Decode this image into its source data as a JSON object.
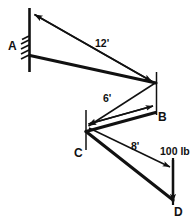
{
  "figure": {
    "type": "engineering-free-body-diagram",
    "ink_color": "#111111",
    "background_color": "#ffffff"
  },
  "supports": [
    {
      "name": "fixed-wall-support",
      "at_node": "A",
      "hatching_marks": 5
    }
  ],
  "nodes": [
    {
      "id": "A",
      "label": "A"
    },
    {
      "id": "B",
      "label": "B"
    },
    {
      "id": "C",
      "label": "C"
    },
    {
      "id": "D",
      "label": "D"
    }
  ],
  "members": [
    {
      "id": "AB",
      "from": "A",
      "to": "B"
    },
    {
      "id": "BC",
      "from": "B",
      "to": "C"
    },
    {
      "id": "CD",
      "from": "C",
      "to": "D"
    }
  ],
  "dimensions": [
    {
      "id": "AB-length",
      "label": "12'",
      "member": "AB",
      "value": 12,
      "unit": "ft"
    },
    {
      "id": "BC-length",
      "label": "6'",
      "member": "BC",
      "value": 6,
      "unit": "ft"
    },
    {
      "id": "CD-length",
      "label": "8'",
      "member": "CD",
      "value": 8,
      "unit": "ft"
    }
  ],
  "loads": [
    {
      "id": "tip-load",
      "label": "100 lb",
      "magnitude": 100,
      "unit": "lb",
      "at_node": "D",
      "direction": "down"
    }
  ]
}
